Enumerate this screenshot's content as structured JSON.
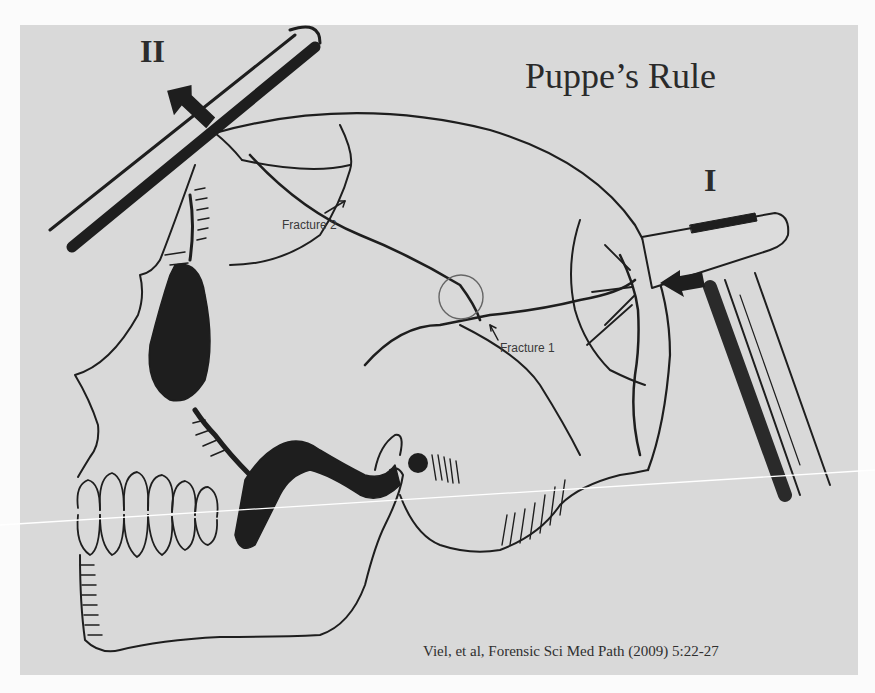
{
  "slide": {
    "title": "Puppe’s Rule",
    "citation": "Viel, et al, Forensic Sci Med Path (2009) 5:22-27",
    "background_color": "#d9d9d9",
    "page_color": "#fbfbfb",
    "ink_color": "#1e1e1e"
  },
  "diagram": {
    "impacts": [
      {
        "id": "impact-1",
        "label": "I",
        "instrument": "hammer",
        "arrow_direction": "left"
      },
      {
        "id": "impact-2",
        "label": "II",
        "instrument": "rod / bar",
        "arrow_direction": "down-right"
      }
    ],
    "fractures": [
      {
        "id": "fracture-1",
        "label": "Fracture 1"
      },
      {
        "id": "fracture-2",
        "label": "Fracture 2"
      }
    ],
    "intersection_marker": "circle"
  }
}
